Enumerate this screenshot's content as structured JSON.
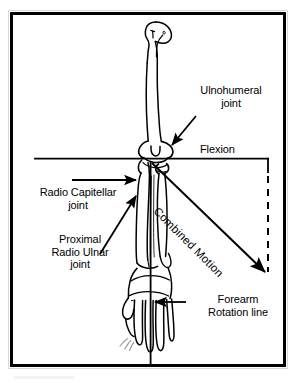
{
  "figure": {
    "border_color": "#000000",
    "background_color": "#ffffff",
    "ink_color": "#000000"
  },
  "labels": {
    "ulnohumeral_joint": "Ulnohumeral\njoint",
    "flexion": "Flexion",
    "radio_capitellar_joint": "Radio Capitellar\njoint",
    "proximal_radio_ulnar_joint": "Proximal\nRadio Ulnar\njoint",
    "forearm_rotation_line": "Forearm\nRotation line",
    "combined_motion": "Combined Motion"
  },
  "annotations": {
    "flexion_axis": "horizontal solid line through the elbow, arrow pointing right",
    "flexion_arc_guide": "dashed vertical line dropping from the right end of the flexion line",
    "combined_motion_arrow": "diagonal arrow from the elbow down to the lower right",
    "forearm_rotation_axis": "vertical solid line from the elbow through the hand",
    "leader_arrows": 4
  },
  "anatomy": {
    "bones": [
      "humerus",
      "radius",
      "ulna",
      "carpals",
      "metacarpals",
      "phalanges"
    ]
  }
}
